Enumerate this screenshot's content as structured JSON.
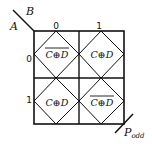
{
  "diagram": {
    "type": "karnaugh-map",
    "row_variable": "A",
    "column_variable": "B",
    "column_headers": [
      "0",
      "1"
    ],
    "row_headers": [
      "0",
      "1"
    ],
    "cells": [
      [
        {
          "expr": "C⊕D",
          "complemented": true
        },
        {
          "expr": "C⊕D",
          "complemented": false
        }
      ],
      [
        {
          "expr": "C⊕D",
          "complemented": false
        },
        {
          "expr": "C⊕D",
          "complemented": true
        }
      ]
    ],
    "output_label": {
      "main": "P",
      "subscript": "odd"
    }
  }
}
